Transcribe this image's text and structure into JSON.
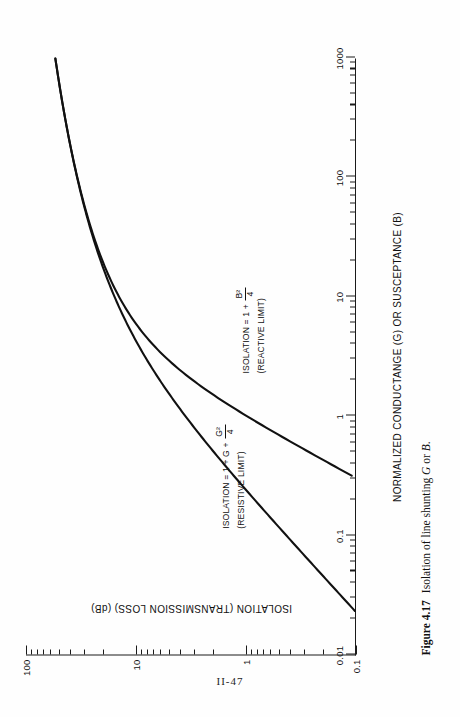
{
  "page": {
    "folio": "II-47"
  },
  "figure": {
    "caption_number": "Figure 4.17",
    "caption_text_pre": "Isolation of line shunting ",
    "caption_italic_1": "G",
    "caption_text_mid": " or ",
    "caption_italic_2": "B",
    "caption_text_post": "."
  },
  "chart_data": {
    "type": "line",
    "title": "",
    "xlabel": "NORMALIZED CONDUCTANGE (G) OR SUSCEPTANCE (B)",
    "ylabel": "ISOLATION (TRANSMISSION LOSS) (dB)",
    "xscale": "log",
    "yscale": "log",
    "xlim": [
      0.01,
      1000
    ],
    "ylim": [
      0.1,
      100
    ],
    "grid": false,
    "legend": "none",
    "xticks": [
      "0.01",
      "0.1",
      "1",
      "10",
      "100",
      "1000"
    ],
    "xtick_values": [
      0.01,
      0.1,
      1,
      10,
      100,
      1000
    ],
    "yticks": [
      "0.1",
      "1",
      "10",
      "100"
    ],
    "ytick_values": [
      0.1,
      1,
      10,
      100
    ],
    "series": [
      {
        "name": "RESISTIVE LIMIT",
        "formula_text": "ISOLATION = 1 + G + G²/4",
        "x": [
          0.01,
          0.02,
          0.05,
          0.1,
          0.2,
          0.5,
          1,
          2,
          5,
          10,
          20,
          50,
          100,
          200,
          500,
          1000
        ],
        "y": [
          0.0436,
          0.0868,
          0.2145,
          0.4238,
          0.8279,
          1.9382,
          3.5218,
          6.0206,
          10.7572,
          15.3958,
          20.8279,
          28.4043,
          34.1514,
          40.0432,
          47.9591,
          53.9783
        ]
      },
      {
        "name": "REACTIVE LIMIT",
        "formula_text": "ISOLATION = 1 + B²/4",
        "x": [
          0.01,
          0.02,
          0.05,
          0.1,
          0.2,
          0.5,
          1,
          2,
          5,
          10,
          20,
          50,
          100,
          200,
          500,
          1000
        ],
        "y": [
          0.000109,
          0.000434,
          0.00271,
          0.01084,
          0.04317,
          0.2633,
          0.9691,
          3.0103,
          8.1908,
          14.1491,
          20.0432,
          27.9617,
          33.9794,
          39.9957,
          47.9583,
          53.9782
        ]
      }
    ],
    "annotations": [
      {
        "id": "resistive-annotation",
        "line1_pre": "ISOLATION = 1 + G + ",
        "line1_frac_num": "G²",
        "line1_frac_den": "4",
        "line2": "(RESISTIVE LIMIT)"
      },
      {
        "id": "reactive-annotation",
        "line1_pre": "ISOLATION = 1 + ",
        "line1_frac_num": "B²",
        "line1_frac_den": "4",
        "line2": "(REACTIVE LIMIT)"
      }
    ]
  }
}
